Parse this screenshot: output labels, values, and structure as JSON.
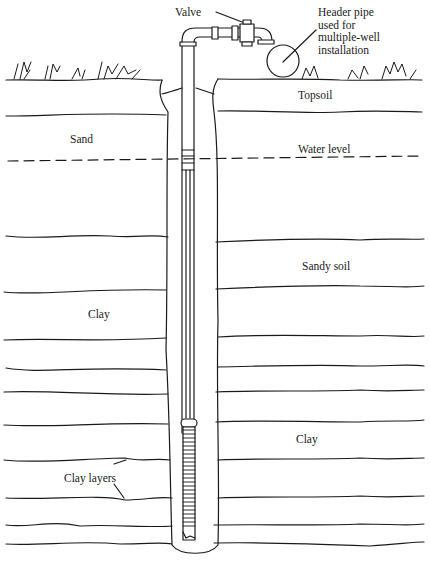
{
  "figure": {
    "type": "cross-section diagram"
  },
  "labels": {
    "valve": "Valve",
    "header_pipe": "Header pipe\nused for\nmultiple-well\ninstallation",
    "topsoil": "Topsoil",
    "sand": "Sand",
    "water_level": "Water level",
    "sandy_soil": "Sandy soil",
    "clay_left": "Clay",
    "clay_right": "Clay",
    "clay_layers": "Clay layers"
  },
  "colors": {
    "ink": "#1a1a1a",
    "background": "#ffffff"
  }
}
